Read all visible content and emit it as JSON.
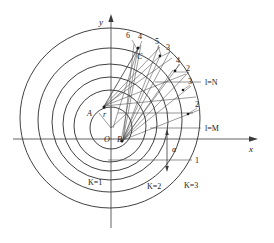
{
  "figure": {
    "axes": {
      "x_label": "x",
      "y_label": "y",
      "origin_label": "O"
    },
    "points": [
      {
        "id": "O",
        "label": "O",
        "x": 111,
        "y": 139
      },
      {
        "id": "B",
        "label": "B",
        "x": 124,
        "y": 139
      },
      {
        "id": "A",
        "label": "A",
        "x": 92,
        "y": 113
      },
      {
        "id": "C",
        "label": "C",
        "x": 141,
        "y": 56
      },
      {
        "id": "r",
        "label": "r",
        "x": 107,
        "y": 113
      }
    ],
    "circle_family_labels": [
      {
        "label": "K=1",
        "x": 96,
        "y": 182
      },
      {
        "label": "K=2",
        "x": 155,
        "y": 186
      },
      {
        "label": "K=3",
        "x": 191,
        "y": 185
      }
    ],
    "layer_labels": [
      {
        "label": "l=N",
        "x": 205,
        "y": 82
      },
      {
        "label": "l=M",
        "x": 205,
        "y": 128
      }
    ],
    "ray_labels": [
      {
        "label": "6",
        "x": 129,
        "y": 36
      },
      {
        "label": "4",
        "x": 140,
        "y": 37
      },
      {
        "label": "5",
        "x": 157,
        "y": 42
      },
      {
        "label": "3",
        "x": 168,
        "y": 48
      },
      {
        "label": "4",
        "x": 178,
        "y": 61
      },
      {
        "label": "2",
        "x": 187,
        "y": 69
      },
      {
        "label": "3",
        "x": 189,
        "y": 82
      },
      {
        "label": "2",
        "x": 196,
        "y": 105
      },
      {
        "label": "1",
        "x": 196,
        "y": 152
      }
    ],
    "angle_label": {
      "label": "α",
      "x": 173,
      "y": 148
    },
    "colors": {
      "stroke": "#2b2b2b",
      "thin_stroke": "#4a4a4a",
      "text": "#1a1a1a",
      "background": "#ffffff"
    }
  }
}
